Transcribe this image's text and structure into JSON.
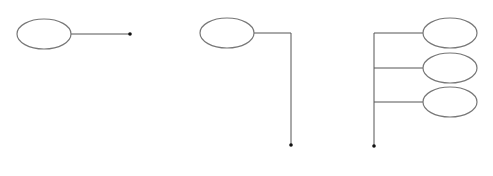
{
  "canvas": {
    "width": 493,
    "height": 176,
    "background": "#ffffff"
  },
  "colors": {
    "ellipse_stroke": "#777777",
    "line": "#555555",
    "dot": "#111111"
  },
  "groups": [
    {
      "name": "single-horizontal-connector",
      "ellipses": [
        {
          "cx": 44,
          "cy": 34,
          "rx": 27,
          "ry": 15
        }
      ],
      "lines": [
        {
          "x1": 71,
          "y1": 34,
          "x2": 130,
          "y2": 34
        }
      ],
      "dot": {
        "cx": 130,
        "cy": 34,
        "r": 1.8
      }
    },
    {
      "name": "elbow-connector",
      "ellipses": [
        {
          "cx": 227,
          "cy": 33,
          "rx": 27,
          "ry": 15
        }
      ],
      "lines": [
        {
          "x1": 254,
          "y1": 33,
          "x2": 291,
          "y2": 33
        },
        {
          "x1": 291,
          "y1": 33,
          "x2": 291,
          "y2": 145
        }
      ],
      "dot": {
        "cx": 291,
        "cy": 145,
        "r": 1.8
      }
    },
    {
      "name": "multi-branch-connector",
      "ellipses": [
        {
          "cx": 450,
          "cy": 33,
          "rx": 27,
          "ry": 15
        },
        {
          "cx": 450,
          "cy": 68,
          "rx": 27,
          "ry": 15
        },
        {
          "cx": 450,
          "cy": 102,
          "rx": 27,
          "ry": 15
        }
      ],
      "lines": [
        {
          "x1": 374,
          "y1": 33,
          "x2": 374,
          "y2": 146
        },
        {
          "x1": 374,
          "y1": 33,
          "x2": 423,
          "y2": 33
        },
        {
          "x1": 374,
          "y1": 68,
          "x2": 423,
          "y2": 68
        },
        {
          "x1": 374,
          "y1": 102,
          "x2": 423,
          "y2": 102
        }
      ],
      "dot": {
        "cx": 374,
        "cy": 146,
        "r": 1.8
      }
    }
  ]
}
